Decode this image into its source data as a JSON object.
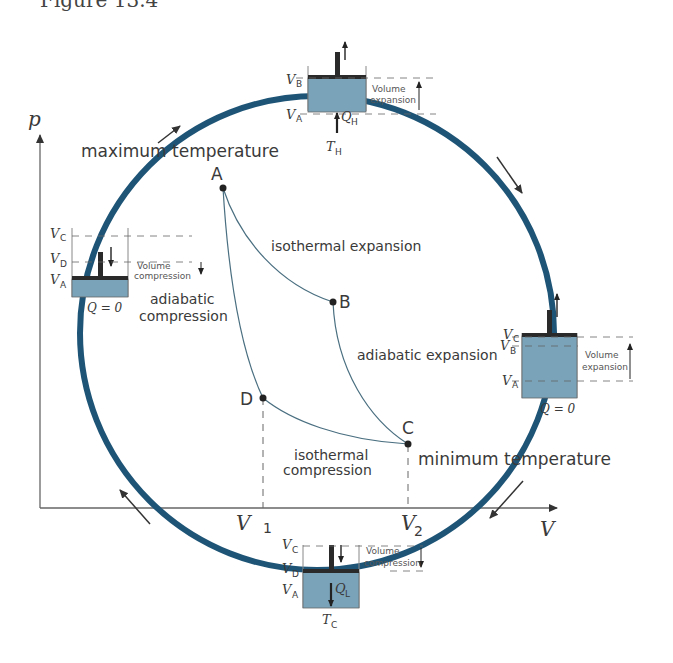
{
  "caption": "Figure 13.4",
  "axes": {
    "y_label": "p",
    "x_label": "V",
    "v1_label": "V",
    "v1_sub": "1",
    "v2_label": "V",
    "v2_sub": "2"
  },
  "points": {
    "A": "A",
    "B": "B",
    "C": "C",
    "D": "D"
  },
  "processes": {
    "isothermal_expansion": "isothermal expansion",
    "adiabatic_expansion": "adiabatic expansion",
    "isothermal_compression_1": "isothermal",
    "isothermal_compression_2": "compression",
    "adiabatic_compression_1": "adiabatic",
    "adiabatic_compression_2": "compression"
  },
  "temperatures": {
    "max": "maximum temperature",
    "min": "minimum temperature"
  },
  "cylinders": {
    "top": {
      "label_upper": "V",
      "sub_upper": "B",
      "label_lower": "V",
      "sub_lower": "A",
      "heat": "Q",
      "heat_sub": "H",
      "reservoir": "T",
      "reservoir_sub": "H",
      "note1": "Volume",
      "note2": "expansion"
    },
    "right": {
      "label_c": "V",
      "sub_c": "C",
      "label_b": "V",
      "sub_b": "B",
      "label_a": "V",
      "sub_a": "A",
      "heat": "Q = 0",
      "note1": "Volume",
      "note2": "expansion"
    },
    "bottom": {
      "label_c": "V",
      "sub_c": "C",
      "label_d": "V",
      "sub_d": "D",
      "label_a": "V",
      "sub_a": "A",
      "heat": "Q",
      "heat_sub": "L",
      "reservoir": "T",
      "reservoir_sub": "C",
      "note1": "Volume",
      "note2": "compression"
    },
    "left": {
      "label_c": "V",
      "sub_c": "C",
      "label_d": "V",
      "sub_d": "D",
      "label_a": "V",
      "sub_a": "A",
      "heat": "Q = 0",
      "note1": "Volume",
      "note2": "compression"
    }
  },
  "colors": {
    "cycle_ring": "#1e5577",
    "gas_fill": "#7aa3b9",
    "piston": "#2a2a2a",
    "curve": "#4a6f80",
    "axis": "#555555",
    "arrow": "#333333"
  }
}
